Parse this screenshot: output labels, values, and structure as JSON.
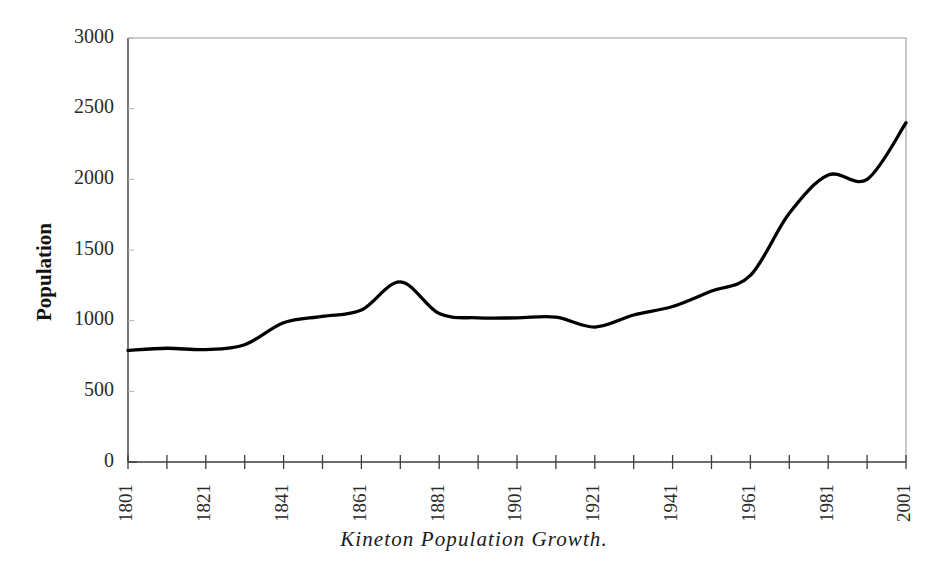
{
  "figure": {
    "caption": "Kineton Population Growth.",
    "background_color": "#ffffff"
  },
  "axes": {
    "y_title": "Population",
    "y_tick_labels": [
      "3000",
      "2500",
      "2000",
      "1500",
      "1000",
      "500",
      "0"
    ],
    "x_tick_labels": [
      "1801",
      "1821",
      "1841",
      "1861",
      "1881",
      "1901",
      "1921",
      "1941",
      "1961",
      "1981",
      "2001"
    ]
  },
  "chart_data": {
    "type": "line",
    "title": "Kineton Population Growth.",
    "xlabel": "",
    "ylabel": "Population",
    "xlim": [
      1801,
      2001
    ],
    "ylim": [
      0,
      3000
    ],
    "yticks": [
      0,
      500,
      1000,
      1500,
      2000,
      2500,
      3000
    ],
    "xticks": [
      1801,
      1811,
      1821,
      1831,
      1841,
      1851,
      1861,
      1871,
      1881,
      1891,
      1901,
      1911,
      1921,
      1931,
      1941,
      1951,
      1961,
      1971,
      1981,
      1991,
      2001
    ],
    "xtick_labels_shown": [
      1801,
      1821,
      1841,
      1861,
      1881,
      1901,
      1921,
      1941,
      1961,
      1981,
      2001
    ],
    "grid": false,
    "legend": false,
    "line_color": "#000000",
    "x": [
      1801,
      1811,
      1821,
      1831,
      1841,
      1851,
      1861,
      1871,
      1881,
      1891,
      1901,
      1911,
      1921,
      1931,
      1941,
      1951,
      1961,
      1971,
      1981,
      1991,
      2001
    ],
    "series": [
      {
        "name": "Population",
        "values": [
          790,
          805,
          795,
          830,
          985,
          1030,
          1075,
          1275,
          1050,
          1020,
          1020,
          1025,
          955,
          1040,
          1100,
          1210,
          1320,
          1760,
          2030,
          2000,
          2400
        ]
      }
    ]
  }
}
